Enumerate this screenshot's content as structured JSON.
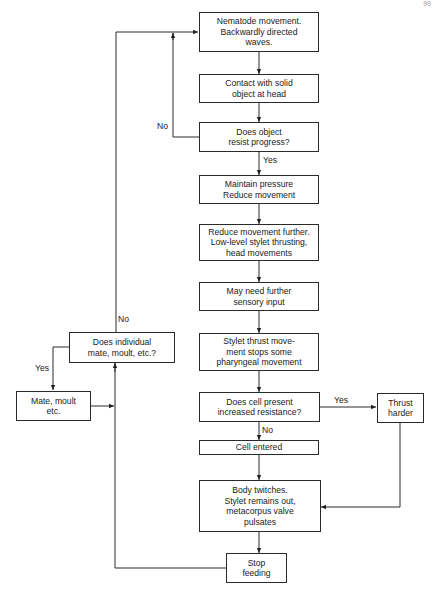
{
  "page_number": "99",
  "boxes": {
    "nematode_movement": "Nematode movement.\nBackwardly directed\nwaves.",
    "contact_solid_object": "Contact with solid\nobject at head",
    "does_object_resist": "Does object\nresist progress?",
    "maintain_pressure": "Maintain pressure\nReduce movement",
    "reduce_movement_further": "Reduce movement further.\nLow-level stylet thrusting,\nhead movements",
    "sensory_input": "May need further\nsensory input",
    "stylet_thrust": "Stylet thrust move-\nment stops some\npharyngeal movement",
    "does_cell_resist": "Does cell present\nincreased resistance?",
    "thrust_harder": "Thrust\nharder",
    "cell_entered": "Cell entered",
    "body_twitches": "Body twitches.\nStylet remains out,\nmetacorpus valve\npulsates",
    "stop_feeding": "Stop\nfeeding",
    "does_individual_mate": "Does individual\nmate, moult, etc.?",
    "mate_moult": "Mate, moult\netc."
  },
  "labels": {
    "no_object": "No",
    "yes_object": "Yes",
    "yes_cell": "Yes",
    "no_cell": "No",
    "no_individual": "No",
    "yes_individual": "Yes"
  }
}
